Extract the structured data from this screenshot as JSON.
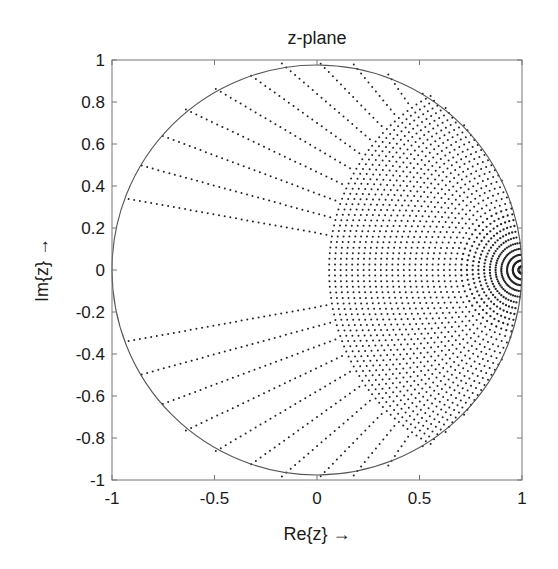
{
  "chart_data": {
    "type": "scatter",
    "title": "z-plane",
    "xlabel": "Re{z} →",
    "ylabel": "Im{z} →",
    "xlim": [
      -1,
      1
    ],
    "ylim": [
      -1,
      1
    ],
    "xticks": [
      -1,
      -0.5,
      0,
      0.5,
      1
    ],
    "xtick_labels": [
      "-1",
      "-0.5",
      "0",
      "0.5",
      "1"
    ],
    "yticks": [
      -1,
      -0.8,
      -0.6,
      -0.4,
      -0.2,
      0,
      0.2,
      0.4,
      0.6,
      0.8,
      1
    ],
    "ytick_labels": [
      "-1",
      "-0.8",
      "-0.6",
      "-0.4",
      "-0.2",
      "0",
      "0.2",
      "0.4",
      "0.6",
      "0.8",
      "1"
    ],
    "grid": false,
    "legend": null,
    "unit_circle": {
      "center": [
        0,
        0
      ],
      "radius": 1
    },
    "point_grid": {
      "description": "Dots z = 1 - rho * exp(j*phi), arcs centered at z=1, clipped to unit disk",
      "phi_min_deg": 10,
      "phi_max_deg": 90,
      "phi_step_deg": 5,
      "rho_step": 0.028,
      "rho_max": 2.0
    },
    "colors": {
      "dots": "#222222",
      "circle": "#555555",
      "axes": "#777777"
    }
  },
  "plot_box": {
    "left": 112,
    "top": 60,
    "right": 522,
    "bottom": 480
  }
}
